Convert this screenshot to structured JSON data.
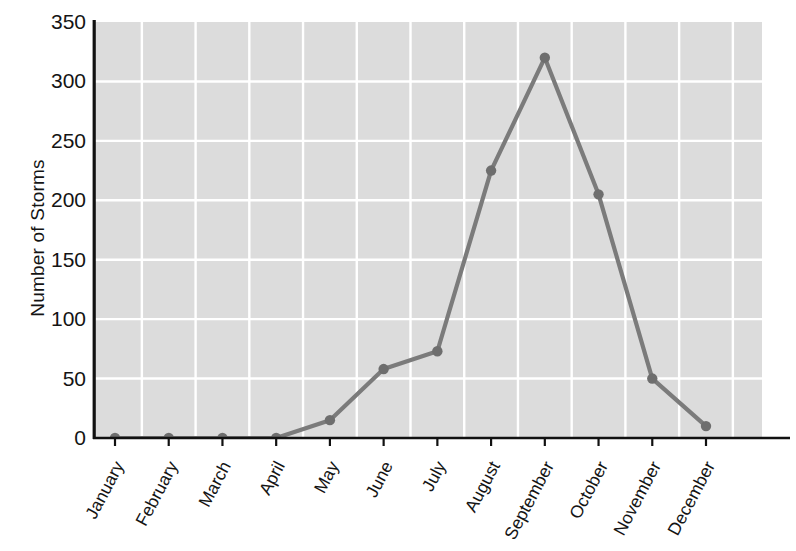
{
  "chart_data": {
    "type": "line",
    "title": "",
    "xlabel": "",
    "ylabel": "Number of Storms",
    "categories": [
      "January",
      "February",
      "March",
      "April",
      "May",
      "June",
      "July",
      "August",
      "September",
      "October",
      "November",
      "December"
    ],
    "values": [
      0,
      0,
      0,
      0,
      15,
      58,
      73,
      225,
      320,
      205,
      50,
      10
    ],
    "series": [
      {
        "name": "Number of Storms",
        "values": [
          0,
          0,
          0,
          0,
          15,
          58,
          73,
          225,
          320,
          205,
          50,
          10
        ]
      }
    ],
    "ylim": [
      0,
      350
    ],
    "yticks": [
      0,
      50,
      100,
      150,
      200,
      250,
      300,
      350
    ],
    "ytick_labels": [
      "0",
      "50",
      "100",
      "150",
      "200",
      "250",
      "300",
      "350"
    ],
    "grid": "both",
    "grid_color": "#ffffff",
    "plot_background": "#dcdcdc",
    "line_color": "#7b7b7b",
    "marker_color": "#6e6e6e",
    "marker": "circle",
    "legend": "none",
    "axis_color": "#000000"
  }
}
